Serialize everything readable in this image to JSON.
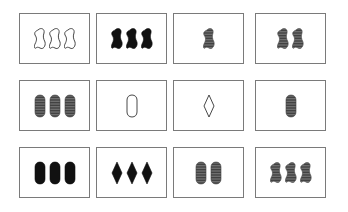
{
  "game": "Set",
  "board": {
    "rows": 3,
    "cols": 4,
    "cards": [
      {
        "count": 3,
        "shape": "squiggle",
        "fill": "open",
        "color": "#333333"
      },
      {
        "count": 3,
        "shape": "squiggle",
        "fill": "solid",
        "color": "#111111"
      },
      {
        "count": 1,
        "shape": "squiggle",
        "fill": "striped",
        "color": "#444444"
      },
      {
        "count": 2,
        "shape": "squiggle",
        "fill": "striped",
        "color": "#444444"
      },
      {
        "count": 3,
        "shape": "oval",
        "fill": "striped",
        "color": "#444444"
      },
      {
        "count": 1,
        "shape": "oval",
        "fill": "open",
        "color": "#333333"
      },
      {
        "count": 1,
        "shape": "diamond",
        "fill": "open",
        "color": "#333333"
      },
      {
        "count": 1,
        "shape": "oval",
        "fill": "striped",
        "color": "#444444"
      },
      {
        "count": 3,
        "shape": "oval",
        "fill": "solid",
        "color": "#111111"
      },
      {
        "count": 3,
        "shape": "diamond",
        "fill": "solid",
        "color": "#111111"
      },
      {
        "count": 2,
        "shape": "oval",
        "fill": "striped",
        "color": "#444444"
      },
      {
        "count": 3,
        "shape": "squiggle",
        "fill": "striped",
        "color": "#444444"
      }
    ]
  }
}
